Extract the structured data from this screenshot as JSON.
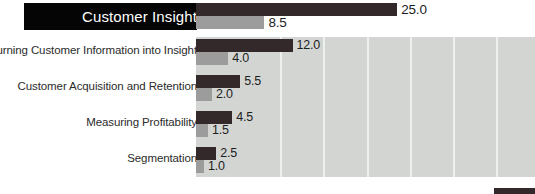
{
  "chart_data": {
    "type": "bar",
    "orientation": "horizontal",
    "title": "",
    "xlabel": "",
    "ylabel": "",
    "grid": true,
    "grid_axis": "x",
    "legend_position": "bottom-right",
    "xlim": [
      0,
      42
    ],
    "categories": [
      "Customer Insight",
      "Turning Customer Information into Insight",
      "Customer Acquisition and Retention",
      "Measuring Profitability",
      "Segmentation"
    ],
    "highlighted_category": "Customer Insight",
    "series": [
      {
        "name": "series-dark",
        "color": "#33292a",
        "values": [
          25.0,
          12.0,
          5.5,
          4.5,
          2.5
        ],
        "labels": [
          "25.0",
          "12.0",
          "5.5",
          "4.5",
          "2.5"
        ]
      },
      {
        "name": "series-light",
        "color": "#9b9c9b",
        "values": [
          8.5,
          4.0,
          2.0,
          1.5,
          1.0
        ],
        "labels": [
          "8.5",
          "4.0",
          "2.0",
          "1.5",
          "1.0"
        ]
      }
    ]
  },
  "colors": {
    "plot_background": "#d3d5d3",
    "gridline": "#eef0ee",
    "dark_bar": "#33292a",
    "light_bar": "#9b9c9b",
    "highlight_box": "#050505",
    "highlight_text": "#ffffff",
    "label_text": "#2b2b2b"
  },
  "layout": {
    "plot_left_px": 196,
    "px_per_unit": 8.05,
    "gridline_positions_px": [
      280,
      323,
      367,
      410,
      453,
      496
    ],
    "rows": [
      {
        "label_y": 8,
        "dark_y": 3,
        "dark_h": 13,
        "light_y": 16,
        "light_h": 13
      },
      {
        "label_y": 44,
        "dark_y": 39,
        "dark_h": 13,
        "light_y": 52,
        "light_h": 13
      },
      {
        "label_y": 80,
        "dark_y": 75,
        "dark_h": 13,
        "light_y": 88,
        "light_h": 13
      },
      {
        "label_y": 116,
        "dark_y": 111,
        "dark_h": 13,
        "light_y": 124,
        "light_h": 13
      },
      {
        "label_y": 152,
        "dark_y": 147,
        "dark_h": 13,
        "light_y": 160,
        "light_h": 13
      }
    ]
  }
}
